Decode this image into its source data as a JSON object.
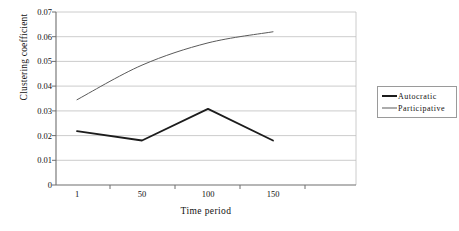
{
  "chart_data": {
    "type": "line",
    "title": "",
    "xlabel": "Time period",
    "ylabel": "Clustering coefficient",
    "x": [
      1,
      50,
      100,
      150
    ],
    "xtick_labels": [
      "1",
      "50",
      "100",
      "150"
    ],
    "ytick_labels": [
      "0.07",
      "0.06",
      "0.05",
      "0.04",
      "0.03",
      "0.02",
      "0.01",
      "0"
    ],
    "yticks": [
      0.07,
      0.06,
      0.05,
      0.04,
      0.03,
      0.02,
      0.01,
      0
    ],
    "ylim": [
      0,
      0.07
    ],
    "xlim": [
      0,
      200
    ],
    "grid": "horizontal",
    "legend_position": "right",
    "series": [
      {
        "name": "Autocratic",
        "values": [
          0.0218,
          0.018,
          0.0308,
          0.018
        ],
        "color": "#1c1c1c",
        "width": 1.8,
        "smooth": false
      },
      {
        "name": "Participative",
        "values": [
          0.0345,
          0.0485,
          0.0575,
          0.062
        ],
        "color": "#5a5a5a",
        "width": 1.0,
        "smooth": true
      }
    ]
  },
  "axes": {
    "y_title": "Clustering coefficient",
    "x_title": "Time period",
    "y_labels": [
      "0.07",
      "0.06",
      "0.05",
      "0.04",
      "0.03",
      "0.02",
      "0.01",
      "0"
    ],
    "x_labels": [
      "1",
      "50",
      "100",
      "150"
    ]
  },
  "legend": {
    "items": [
      {
        "label": "Autocratic",
        "style": "thick"
      },
      {
        "label": "Participative",
        "style": "thin"
      }
    ]
  },
  "colors": {
    "axis": "#6e6e6e",
    "grid": "#bfbfbf",
    "series_autocratic": "#1c1c1c",
    "series_participative": "#5a5a5a",
    "legend_border": "#9a9a9a",
    "background": "#ffffff"
  }
}
